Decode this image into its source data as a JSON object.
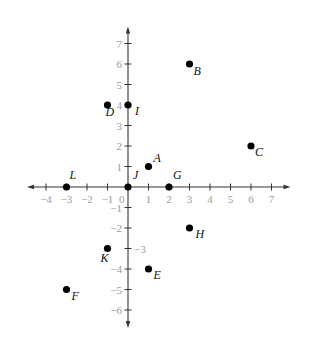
{
  "diagram": {
    "type": "coordinate-plane",
    "origin_label": "0",
    "x_axis": {
      "min_tick": -4,
      "max_tick": 7,
      "tick_labels": [
        "-4",
        "-3",
        "-2",
        "-1",
        "1",
        "2",
        "3",
        "4",
        "5",
        "6",
        "7"
      ]
    },
    "y_axis": {
      "min_tick": -6,
      "max_tick": 7,
      "tick_labels": [
        "7",
        "6",
        "5",
        "4",
        "3",
        "2",
        "1",
        "-1",
        "-2",
        "-3",
        "-4",
        "-5",
        "-6"
      ]
    },
    "points": [
      {
        "label": "A",
        "x": 1,
        "y": 1
      },
      {
        "label": "B",
        "x": 3,
        "y": 6
      },
      {
        "label": "C",
        "x": 6,
        "y": 2
      },
      {
        "label": "D",
        "x": -1,
        "y": 4
      },
      {
        "label": "E",
        "x": 1,
        "y": -4
      },
      {
        "label": "F",
        "x": -3,
        "y": -5
      },
      {
        "label": "G",
        "x": 2,
        "y": 0
      },
      {
        "label": "H",
        "x": 3,
        "y": -2
      },
      {
        "label": "I",
        "x": 0,
        "y": 4
      },
      {
        "label": "J",
        "x": 0,
        "y": 0
      },
      {
        "label": "K",
        "x": -1,
        "y": -3
      },
      {
        "label": "L",
        "x": -3,
        "y": 0
      }
    ]
  },
  "colors": {
    "axis": "#333333",
    "tick_label": "#9a9a9a",
    "point": "#000000",
    "point_label": "#111111",
    "background": "#ffffff"
  }
}
